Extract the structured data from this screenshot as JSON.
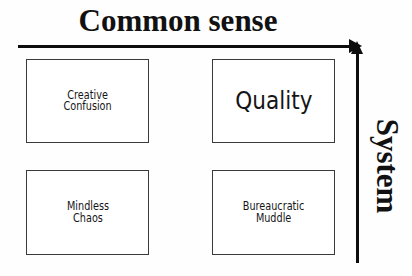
{
  "diagram": {
    "type": "2x2-matrix",
    "horizontal_axis": {
      "label": "Common sense",
      "arrow_direction": "right"
    },
    "vertical_axis": {
      "label": "System",
      "arrow_direction": "up"
    },
    "quadrants": [
      {
        "position": "top-left",
        "label": "Creative\nConfusion",
        "emphasis": "normal"
      },
      {
        "position": "top-right",
        "label": "Quality",
        "emphasis": "large"
      },
      {
        "position": "bottom-left",
        "label": "Mindless\nChaos",
        "emphasis": "normal"
      },
      {
        "position": "bottom-right",
        "label": "Bureaucratic\nMuddle",
        "emphasis": "normal"
      }
    ],
    "colors": {
      "ink": "#0d0d0d",
      "box_border": "#3a3a3a",
      "background": "#fefefe"
    }
  }
}
